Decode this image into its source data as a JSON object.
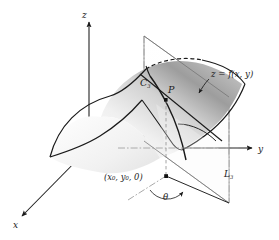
{
  "figure": {
    "background_color": "#ffffff",
    "ink_color": "#1a1a1a",
    "surface_fill_light": "#f2f2f2",
    "surface_fill_dark": "#8e8e8e",
    "plane_fill": "#ffffff",
    "dash_color": "#9a9a9a"
  },
  "axes": {
    "z_label": "z",
    "y_label": "y",
    "x_label": "x",
    "origin_label": ""
  },
  "labels": {
    "surface": "z = f(x, y)",
    "curve": "C",
    "curve_sub": "3",
    "point": "P",
    "line": "L",
    "line_sub": "3",
    "foot_point": "(x₀, y₀, 0)",
    "angle": "θ"
  },
  "elements": {
    "surface_name": "saddle-surface",
    "plane_name": "vertical-cutting-plane",
    "curve_name": "trace-curve-c3",
    "tangent_name": "tangent-line-at-p",
    "point_name": "point-p-marker",
    "foot_name": "foot-point-marker",
    "angle_arc_name": "angle-theta-arc"
  }
}
